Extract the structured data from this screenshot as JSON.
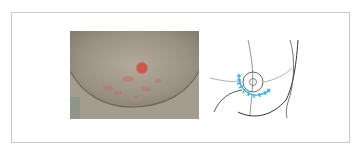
{
  "figure": {
    "panels": [
      {
        "id": "photo",
        "kind": "clinical-photograph",
        "description": "Clinical photograph of skin with scattered red patches around a central raised area"
      },
      {
        "id": "diagram",
        "kind": "line-drawing",
        "description": "Outline schematic with concentric circles and a blue hatched arc marking the affected region",
        "colors": {
          "outline": "#333333",
          "outline_light": "#999999",
          "marker": "#3ab0e0"
        }
      }
    ],
    "colors": {
      "border": "#c8c8c8",
      "background": "#ffffff"
    }
  }
}
